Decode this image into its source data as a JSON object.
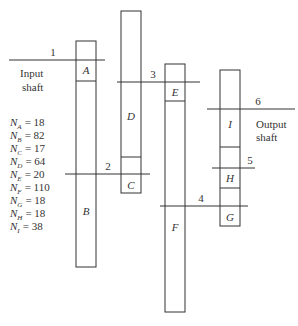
{
  "diagram": {
    "type": "gear-train",
    "shafts": [
      {
        "id": "1",
        "label": "1"
      },
      {
        "id": "2",
        "label": "2"
      },
      {
        "id": "3",
        "label": "3"
      },
      {
        "id": "4",
        "label": "4"
      },
      {
        "id": "5",
        "label": "5"
      },
      {
        "id": "6",
        "label": "6"
      }
    ],
    "gears": [
      {
        "id": "A",
        "label": "A"
      },
      {
        "id": "B",
        "label": "B"
      },
      {
        "id": "C",
        "label": "C"
      },
      {
        "id": "D",
        "label": "D"
      },
      {
        "id": "E",
        "label": "E"
      },
      {
        "id": "F",
        "label": "F"
      },
      {
        "id": "G",
        "label": "G"
      },
      {
        "id": "H",
        "label": "H"
      },
      {
        "id": "I",
        "label": "I"
      }
    ],
    "input_label": {
      "line1": "Input",
      "line2": "shaft"
    },
    "output_label": {
      "line1": "Output",
      "line2": "shaft"
    },
    "tooth_counts": [
      {
        "sub": "A",
        "value": "= 18"
      },
      {
        "sub": "B",
        "value": "= 82"
      },
      {
        "sub": "C",
        "value": "= 17"
      },
      {
        "sub": "D",
        "value": "= 64"
      },
      {
        "sub": "E",
        "value": "= 20"
      },
      {
        "sub": "F",
        "value": "= 110"
      },
      {
        "sub": "G",
        "value": "= 18"
      },
      {
        "sub": "H",
        "value": "= 18"
      },
      {
        "sub": "I",
        "value": "= 38"
      }
    ],
    "n_symbol": "N"
  }
}
